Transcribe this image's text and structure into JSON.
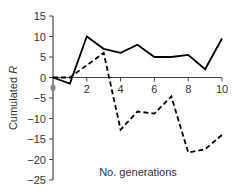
{
  "chart_data": {
    "type": "line",
    "title": "",
    "xlabel": "No. generations",
    "ylabel": "Cumulated R",
    "x": [
      0,
      1,
      2,
      3,
      4,
      5,
      6,
      7,
      8,
      9,
      10
    ],
    "xticks": [
      2,
      4,
      6,
      8,
      10
    ],
    "yticks": [
      15,
      10,
      5,
      0,
      -5,
      -10,
      -15,
      -20,
      -25
    ],
    "xlim": [
      0,
      10
    ],
    "ylim": [
      -25,
      15
    ],
    "grid": false,
    "legend": null,
    "series": [
      {
        "name": "solid",
        "style": "solid",
        "color": "#000000",
        "values": [
          0,
          -1.5,
          10,
          7,
          6,
          8,
          5,
          5,
          5.5,
          2,
          9.5
        ]
      },
      {
        "name": "dashed",
        "style": "dashed",
        "color": "#000000",
        "values": [
          0,
          0,
          3,
          6,
          -12.7,
          -8.3,
          -8.8,
          -4.6,
          -18.3,
          -17.5,
          -14
        ]
      }
    ],
    "annotations": [
      {
        "type": "marker",
        "x": 0,
        "y": -2.5,
        "color": "#888888"
      }
    ]
  }
}
